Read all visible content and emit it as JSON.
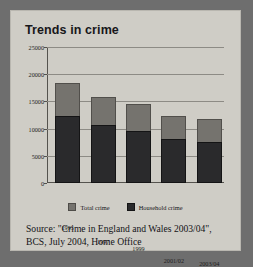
{
  "figure": {
    "title": "Trends in crime",
    "source_line1": "Source: \"Crime in England and Wales 2003/04\",",
    "source_line2": "BCS, July 2004, Home Office"
  },
  "chart_data": {
    "type": "bar",
    "title": "Trends in crime",
    "xlabel": "",
    "ylabel": "",
    "ylim": [
      0,
      25000
    ],
    "yticks": [
      0,
      5000,
      10000,
      15000,
      20000,
      25000
    ],
    "ytick_labels": [
      "0",
      "5000",
      "10000",
      "15000",
      "20000",
      "25000"
    ],
    "grid": true,
    "legend_position": "bottom",
    "stacked": true,
    "categories": [
      "1995",
      "1997",
      "1999",
      "2001/02",
      "2003/04"
    ],
    "series": [
      {
        "name": "Total crime",
        "color": "#75736e",
        "values": [
          18300,
          15900,
          14600,
          12400,
          11700
        ]
      },
      {
        "name": "Household crime",
        "color": "#2a2a2c",
        "values": [
          12400,
          10600,
          9600,
          8100,
          7600
        ]
      }
    ],
    "note": "Bars are stacked: the dark 'Household crime' segment sits inside the taller grey 'Total crime' bar."
  }
}
